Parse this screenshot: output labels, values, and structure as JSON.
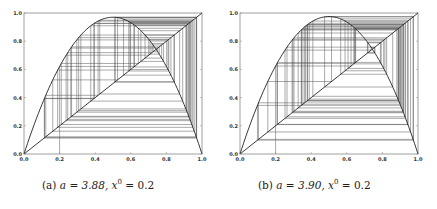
{
  "chart_data": [
    {
      "type": "line",
      "title": "Cobweb diagram of logistic map x_{k+1} = a x_k (1 - x_k)",
      "caption": {
        "label": "(a)",
        "a_text": "a = 3.88",
        "x0_text": "x",
        "x0_sup": "0",
        "x0_val": " = 0.2"
      },
      "a": 3.88,
      "x0": 0.2,
      "iterations": 60,
      "xlim": [
        0.0,
        1.0
      ],
      "ylim": [
        0.0,
        1.0
      ],
      "xticks": [
        "0.0",
        "0.2",
        "0.4",
        "0.6",
        "0.8",
        "1.0"
      ],
      "yticks": [
        "0.0",
        "0.2",
        "0.4",
        "0.6",
        "0.8",
        "1.0"
      ],
      "series": [
        {
          "name": "f(x) = a x (1 - x)",
          "peak": 0.97
        },
        {
          "name": "y = x"
        },
        {
          "name": "cobweb iterates"
        }
      ],
      "grid": false,
      "legend": "none"
    },
    {
      "type": "line",
      "title": "Cobweb diagram of logistic map x_{k+1} = a x_k (1 - x_k)",
      "caption": {
        "label": "(b)",
        "a_text": "a = 3.90",
        "x0_text": "x",
        "x0_sup": "0",
        "x0_val": " = 0.2"
      },
      "a": 3.9,
      "x0": 0.2,
      "iterations": 60,
      "xlim": [
        0.0,
        1.0
      ],
      "ylim": [
        0.0,
        1.0
      ],
      "xticks": [
        "0.0",
        "0.2",
        "0.4",
        "0.6",
        "0.8",
        "1.0"
      ],
      "yticks": [
        "0.0",
        "0.2",
        "0.4",
        "0.6",
        "0.8",
        "1.0"
      ],
      "series": [
        {
          "name": "f(x) = a x (1 - x)",
          "peak": 0.975
        },
        {
          "name": "y = x"
        },
        {
          "name": "cobweb iterates"
        }
      ],
      "grid": false,
      "legend": "none"
    }
  ],
  "style": {
    "curve_color": "#222222",
    "cobweb_color": "#555555",
    "axis_color": "#888888"
  },
  "captions": {
    "a": {
      "label": "(a)",
      "a_text": "a = 3.88,",
      "x_var": "x",
      "x_sup": "0",
      "x_val": " = 0.2"
    },
    "b": {
      "label": "(b)",
      "a_text": "a = 3.90,",
      "x_var": "x",
      "x_sup": "0",
      "x_val": " = 0.2"
    }
  }
}
